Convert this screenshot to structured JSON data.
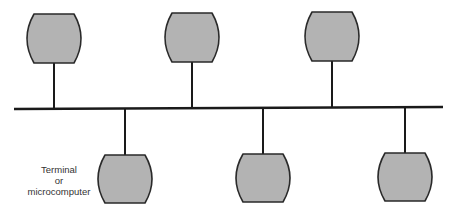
{
  "diagram": {
    "type": "bus-network",
    "colors": {
      "line": "#1a1a1a",
      "terminal_fill": "#b3b3b3",
      "terminal_stroke": "#2a2a2a",
      "background": "#ffffff"
    },
    "bus": {
      "x1": 14,
      "y1": 109,
      "x2": 443,
      "y2": 107
    },
    "terminals": [
      {
        "id": "top-1",
        "position": "top",
        "cx": 54,
        "top": 14,
        "bottom": 63
      },
      {
        "id": "top-2",
        "position": "top",
        "cx": 192,
        "top": 13,
        "bottom": 62
      },
      {
        "id": "top-3",
        "position": "top",
        "cx": 332,
        "top": 12,
        "bottom": 61
      },
      {
        "id": "bottom-1",
        "position": "bottom",
        "cx": 125,
        "top": 155,
        "bottom": 203
      },
      {
        "id": "bottom-2",
        "position": "bottom",
        "cx": 263,
        "top": 154,
        "bottom": 202
      },
      {
        "id": "bottom-3",
        "position": "bottom",
        "cx": 405,
        "top": 153,
        "bottom": 201
      }
    ],
    "label": {
      "lines": [
        "Terminal",
        "or",
        "microcomputer"
      ]
    }
  }
}
